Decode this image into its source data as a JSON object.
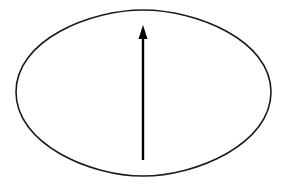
{
  "diagram": {
    "shapes": [
      {
        "type": "ellipse",
        "name": "oval-boundary",
        "stroke": "#1a1a1a",
        "fill": "none"
      },
      {
        "type": "arrow",
        "name": "vertical-arrow",
        "direction": "up",
        "stroke": "#000000"
      }
    ],
    "colors": {
      "background": "#ffffff",
      "stroke": "#1a1a1a",
      "arrow": "#000000"
    }
  }
}
